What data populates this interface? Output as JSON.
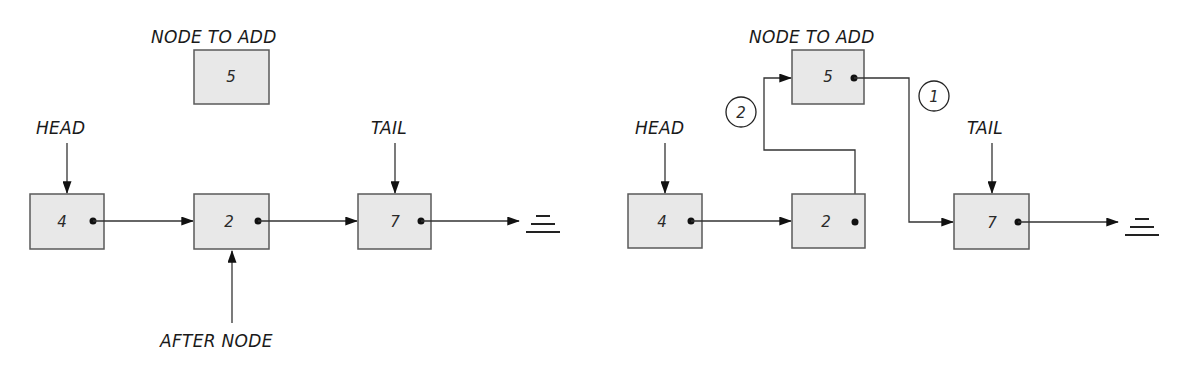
{
  "colors": {
    "node_fill": "#e8e8e8",
    "node_border": "#5a5a5a",
    "line": "#333333",
    "text": "#1a1a1a"
  },
  "left_diagram": {
    "title": "Before insertion",
    "node_to_add_label": "NODE TO ADD",
    "node_to_add_value": "5",
    "head_label": "HEAD",
    "tail_label": "TAIL",
    "after_node_label": "AFTER NODE",
    "nodes": [
      {
        "value": "4"
      },
      {
        "value": "2"
      },
      {
        "value": "7"
      }
    ],
    "null_icon": "null-terminator-icon"
  },
  "right_diagram": {
    "title": "After insertion",
    "node_to_add_label": "NODE TO ADD",
    "node_to_add_value": "5",
    "head_label": "HEAD",
    "tail_label": "TAIL",
    "nodes": [
      {
        "value": "4"
      },
      {
        "value": "2"
      },
      {
        "value": "7"
      }
    ],
    "steps": [
      {
        "number": "1",
        "description": "new node 5 next points to node 7"
      },
      {
        "number": "2",
        "description": "node 2 next points to new node 5"
      }
    ],
    "null_icon": "null-terminator-icon"
  }
}
